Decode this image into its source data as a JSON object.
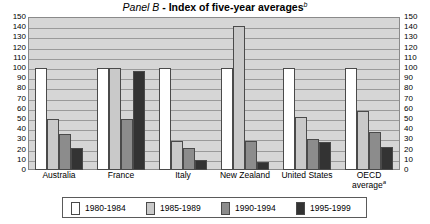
{
  "chart_data": {
    "type": "bar",
    "title": "Panel B - Index of five-year averages",
    "title_italic_part": "Panel B",
    "title_bold_part": " - Index of five-year averages",
    "title_superscript": "b",
    "xlabel": "",
    "ylabel": "",
    "ylim": [
      0,
      150
    ],
    "ytick_step": 10,
    "grid": true,
    "legend_position": "bottom",
    "categories": [
      "Australia",
      "France",
      "Italy",
      "New Zealand",
      "United States",
      "OECD average"
    ],
    "category_superscripts": [
      "",
      "",
      "",
      "",
      "",
      "a"
    ],
    "series": [
      {
        "name": "1980-1984",
        "color": "#ffffff",
        "values": [
          100,
          100,
          100,
          100,
          100,
          100
        ]
      },
      {
        "name": "1985-1989",
        "color": "#c9c9c9",
        "values": [
          50,
          100,
          28,
          141,
          52,
          58
        ]
      },
      {
        "name": "1990-1994",
        "color": "#8c8c8c",
        "values": [
          35,
          50,
          22,
          28,
          30,
          37
        ]
      },
      {
        "name": "1995-1999",
        "color": "#333333",
        "values": [
          22,
          97,
          10,
          8,
          27,
          23
        ]
      }
    ],
    "ytick_labels": [
      "150",
      "140",
      "130",
      "120",
      "110",
      "100",
      "90",
      "80",
      "70",
      "60",
      "50",
      "40",
      "30",
      "20",
      "10",
      "0"
    ],
    "legend_entries": [
      "1980-1984",
      "1985-1989",
      "1990-1994",
      "1995-1999"
    ],
    "axis_left_labels": [
      "150",
      "140",
      "130",
      "120",
      "110",
      "100",
      "90",
      "80",
      "70",
      "60",
      "50",
      "40",
      "30",
      "20",
      "10",
      "0"
    ],
    "axis_right_labels": [
      "150",
      "140",
      "130",
      "120",
      "110",
      "100",
      "90",
      "80",
      "70",
      "60",
      "50",
      "40",
      "30",
      "20",
      "10",
      "0"
    ]
  }
}
